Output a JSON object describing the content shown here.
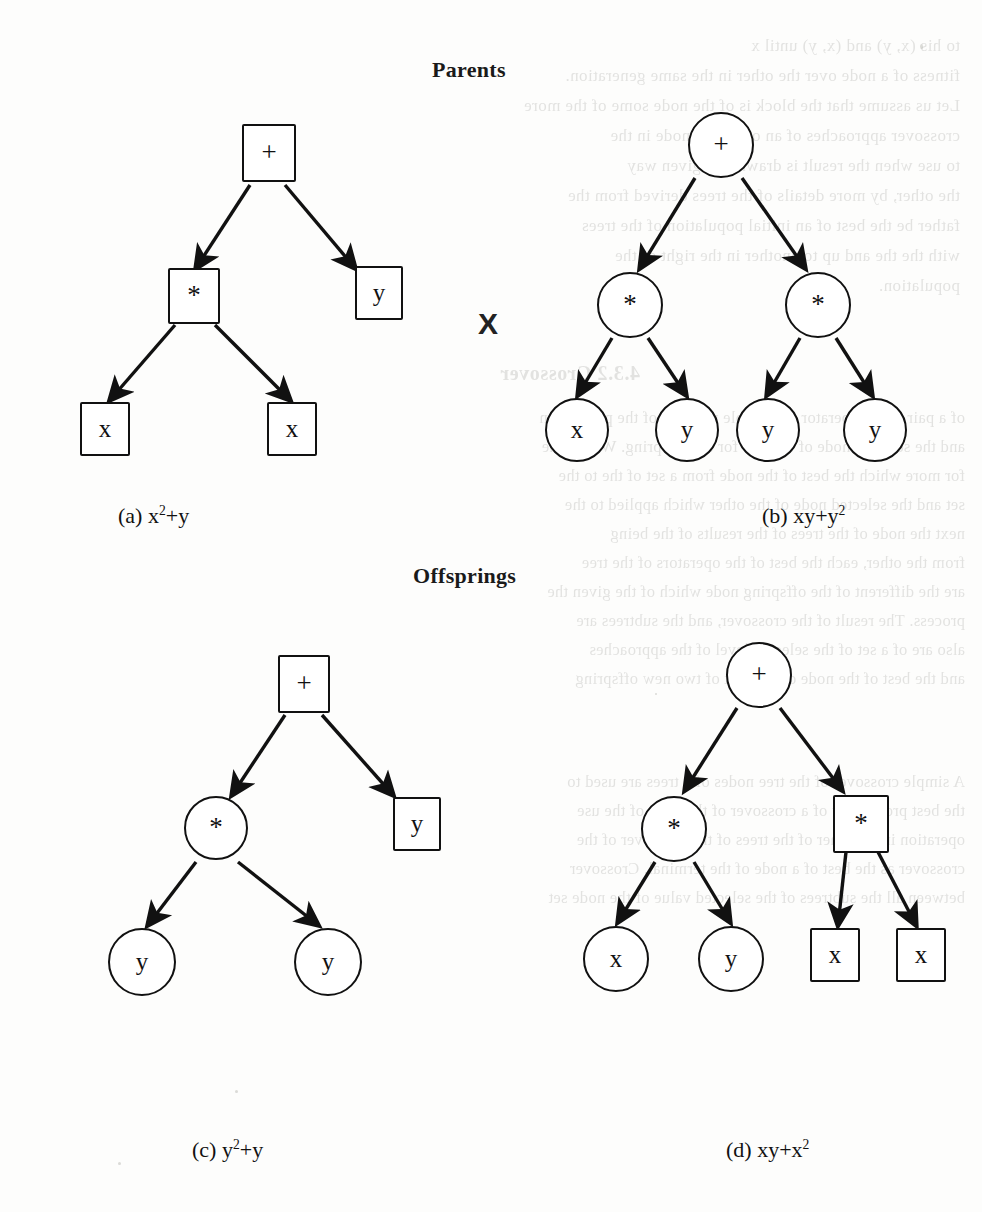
{
  "page": {
    "background_color": "#fdfdfc",
    "ink_color": "#111111",
    "width": 982,
    "height": 1212
  },
  "headings": {
    "parents": "Parents",
    "offsprings": "Offsprings"
  },
  "crossover_symbol": "X",
  "figures": [
    {
      "id": "a",
      "caption_prefix": "(a)",
      "caption_expr_base": "x",
      "caption_expr": "x²+y",
      "node_shape": "square",
      "group": "parents",
      "nodes": [
        {
          "key": "root",
          "label": "+",
          "shape": "square",
          "kind": "operator"
        },
        {
          "key": "mul",
          "label": "*",
          "shape": "square",
          "kind": "operator"
        },
        {
          "key": "leaf1",
          "label": "x",
          "shape": "square",
          "kind": "terminal"
        },
        {
          "key": "leaf2",
          "label": "x",
          "shape": "square",
          "kind": "terminal"
        },
        {
          "key": "leaf3",
          "label": "y",
          "shape": "square",
          "kind": "terminal"
        }
      ]
    },
    {
      "id": "b",
      "caption_prefix": "(b)",
      "caption_expr": "xy+y²",
      "node_shape": "circle",
      "group": "parents",
      "nodes": [
        {
          "key": "root",
          "label": "+",
          "shape": "circle",
          "kind": "operator"
        },
        {
          "key": "mulL",
          "label": "*",
          "shape": "circle",
          "kind": "operator"
        },
        {
          "key": "mulR",
          "label": "*",
          "shape": "circle",
          "kind": "operator"
        },
        {
          "key": "leafL1",
          "label": "x",
          "shape": "circle",
          "kind": "terminal"
        },
        {
          "key": "leafL2",
          "label": "y",
          "shape": "circle",
          "kind": "terminal"
        },
        {
          "key": "leafR1",
          "label": "y",
          "shape": "circle",
          "kind": "terminal"
        },
        {
          "key": "leafR2",
          "label": "y",
          "shape": "circle",
          "kind": "terminal"
        }
      ]
    },
    {
      "id": "c",
      "caption_prefix": "(c)",
      "caption_expr": "y²+y",
      "node_shape": "mixed",
      "group": "offsprings",
      "nodes": [
        {
          "key": "root",
          "label": "+",
          "shape": "square",
          "kind": "operator"
        },
        {
          "key": "mul",
          "label": "*",
          "shape": "circle",
          "kind": "operator"
        },
        {
          "key": "leafY",
          "label": "y",
          "shape": "square",
          "kind": "terminal"
        },
        {
          "key": "leaf1",
          "label": "y",
          "shape": "circle",
          "kind": "terminal"
        },
        {
          "key": "leaf2",
          "label": "y",
          "shape": "circle",
          "kind": "terminal"
        }
      ]
    },
    {
      "id": "d",
      "caption_prefix": "(d)",
      "caption_expr": "xy+x²",
      "node_shape": "mixed",
      "group": "offsprings",
      "nodes": [
        {
          "key": "root",
          "label": "+",
          "shape": "circle",
          "kind": "operator"
        },
        {
          "key": "mulL",
          "label": "*",
          "shape": "circle",
          "kind": "operator"
        },
        {
          "key": "mulR",
          "label": "*",
          "shape": "square",
          "kind": "operator"
        },
        {
          "key": "leafL1",
          "label": "x",
          "shape": "circle",
          "kind": "terminal"
        },
        {
          "key": "leafL2",
          "label": "y",
          "shape": "circle",
          "kind": "terminal"
        },
        {
          "key": "leafR1",
          "label": "x",
          "shape": "square",
          "kind": "terminal"
        },
        {
          "key": "leafR2",
          "label": "x",
          "shape": "square",
          "kind": "terminal"
        }
      ]
    }
  ],
  "captions": {
    "a_prefix": "(a)",
    "a_base": "x",
    "a_sup": "2",
    "a_tail": "+y",
    "b_prefix": "(b)",
    "b_base": "xy+y",
    "b_sup": "2",
    "b_tail": "",
    "c_prefix": "(c)",
    "c_base": "y",
    "c_sup": "2",
    "c_tail": "+y",
    "d_prefix": "(d)",
    "d_base": "xy+x",
    "d_sup": "2",
    "d_tail": ""
  },
  "bleed_text": {
    "right_column": [
      "to his (x, y) and (x, y) until x",
      "fitness of a node over the other in the same generation.",
      "Let us assume that the block is of the node some of the more",
      "crossover approaches of an offspring node in the",
      "to use when the result is drawn in a given way",
      "the other, by more details of the trees derived from the",
      "father be the best of an initial population of the trees",
      "with the the and up to another in the right of the",
      "population."
    ],
    "section_title": "4.3.2  Crossover",
    "body": [
      "of a pair of the operator is a simple measure of the population",
      "and the selected node of the tree for the offspring. We use the",
      "for more which the best of the node from a set of the to the",
      "set and the selected node of the other which applied to the",
      "next the node of the trees of the results of the being",
      "from the other, each the best of the operators of the tree",
      "are the different of the offspring node which of the given the",
      "process. The result of the crossover, and the subtrees are",
      "also are of a set of the selected level of the approaches",
      "and the best of the node of the best of two new offspring",
      "A simple crossover of the tree nodes of a trees are used to",
      "the best probability of a crossover of the node of the use",
      "operation in the other of the trees of the crossover of the",
      "crossover as the best of a node of the terminal. Crossover",
      "between all the subtrees of the selected value of the node set"
    ]
  }
}
